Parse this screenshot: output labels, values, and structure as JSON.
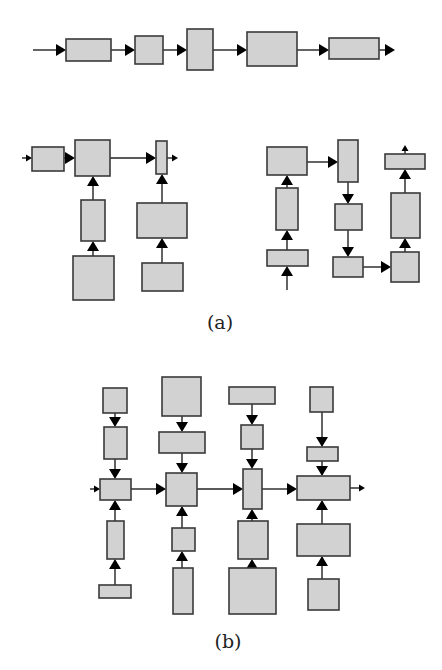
{
  "style": {
    "fill": "#d2d2d2",
    "stroke": "#3a3a3a",
    "line": "#222222"
  },
  "labels": [
    {
      "id": "label-a",
      "text": "(a)",
      "x": 220,
      "y": 313
    },
    {
      "id": "label-b",
      "text": "(b)",
      "x": 228,
      "y": 632
    }
  ],
  "boxes": [
    {
      "id": "t1",
      "x": 66,
      "y": 39,
      "w": 45,
      "h": 22
    },
    {
      "id": "t2",
      "x": 135,
      "y": 36,
      "w": 28,
      "h": 28
    },
    {
      "id": "t3",
      "x": 187,
      "y": 29,
      "w": 26,
      "h": 41
    },
    {
      "id": "t4",
      "x": 247,
      "y": 32,
      "w": 50,
      "h": 34
    },
    {
      "id": "t5",
      "x": 329,
      "y": 38,
      "w": 50,
      "h": 21
    },
    {
      "id": "a1",
      "x": 32,
      "y": 147,
      "w": 32,
      "h": 24
    },
    {
      "id": "a2",
      "x": 75,
      "y": 140,
      "w": 35,
      "h": 36
    },
    {
      "id": "a3",
      "x": 156,
      "y": 141,
      "w": 11,
      "h": 33
    },
    {
      "id": "a4",
      "x": 81,
      "y": 200,
      "w": 24,
      "h": 41
    },
    {
      "id": "a5",
      "x": 73,
      "y": 256,
      "w": 41,
      "h": 44
    },
    {
      "id": "a6",
      "x": 137,
      "y": 203,
      "w": 50,
      "h": 35
    },
    {
      "id": "a7",
      "x": 142,
      "y": 263,
      "w": 41,
      "h": 28
    },
    {
      "id": "r1",
      "x": 267,
      "y": 147,
      "w": 40,
      "h": 28
    },
    {
      "id": "r2",
      "x": 276,
      "y": 188,
      "w": 22,
      "h": 42
    },
    {
      "id": "r3",
      "x": 267,
      "y": 250,
      "w": 41,
      "h": 16
    },
    {
      "id": "r4",
      "x": 338,
      "y": 140,
      "w": 20,
      "h": 42
    },
    {
      "id": "r5",
      "x": 335,
      "y": 204,
      "w": 27,
      "h": 26
    },
    {
      "id": "r6",
      "x": 333,
      "y": 257,
      "w": 30,
      "h": 20
    },
    {
      "id": "r7",
      "x": 391,
      "y": 252,
      "w": 28,
      "h": 30
    },
    {
      "id": "r8",
      "x": 391,
      "y": 193,
      "w": 29,
      "h": 45
    },
    {
      "id": "r9",
      "x": 385,
      "y": 154,
      "w": 40,
      "h": 15
    },
    {
      "id": "b1a",
      "x": 103,
      "y": 388,
      "w": 24,
      "h": 25
    },
    {
      "id": "b1b",
      "x": 104,
      "y": 427,
      "w": 23,
      "h": 32
    },
    {
      "id": "b1m",
      "x": 100,
      "y": 479,
      "w": 31,
      "h": 21
    },
    {
      "id": "b1c",
      "x": 107,
      "y": 521,
      "w": 17,
      "h": 38
    },
    {
      "id": "b1d",
      "x": 99,
      "y": 585,
      "w": 32,
      "h": 13
    },
    {
      "id": "b2a",
      "x": 162,
      "y": 377,
      "w": 39,
      "h": 39
    },
    {
      "id": "b2b",
      "x": 159,
      "y": 432,
      "w": 46,
      "h": 21
    },
    {
      "id": "b2m",
      "x": 166,
      "y": 473,
      "w": 31,
      "h": 33
    },
    {
      "id": "b2c",
      "x": 172,
      "y": 528,
      "w": 23,
      "h": 23
    },
    {
      "id": "b2d",
      "x": 173,
      "y": 568,
      "w": 20,
      "h": 46
    },
    {
      "id": "b3a",
      "x": 229,
      "y": 387,
      "w": 46,
      "h": 17
    },
    {
      "id": "b3b",
      "x": 241,
      "y": 425,
      "w": 22,
      "h": 24
    },
    {
      "id": "b3m",
      "x": 243,
      "y": 469,
      "w": 19,
      "h": 40
    },
    {
      "id": "b3c",
      "x": 238,
      "y": 521,
      "w": 30,
      "h": 38
    },
    {
      "id": "b3d",
      "x": 229,
      "y": 568,
      "w": 47,
      "h": 46
    },
    {
      "id": "b4a",
      "x": 310,
      "y": 387,
      "w": 23,
      "h": 25
    },
    {
      "id": "b4b",
      "x": 307,
      "y": 447,
      "w": 31,
      "h": 14
    },
    {
      "id": "b4m",
      "x": 297,
      "y": 476,
      "w": 53,
      "h": 24
    },
    {
      "id": "b4c",
      "x": 297,
      "y": 524,
      "w": 53,
      "h": 32
    },
    {
      "id": "b4d",
      "x": 308,
      "y": 579,
      "w": 31,
      "h": 31
    }
  ],
  "arrows": [
    {
      "x1": 33,
      "y1": 50,
      "x2": 66,
      "y2": 50
    },
    {
      "x1": 111,
      "y1": 50,
      "x2": 135,
      "y2": 50
    },
    {
      "x1": 163,
      "y1": 50,
      "x2": 187,
      "y2": 50
    },
    {
      "x1": 213,
      "y1": 50,
      "x2": 247,
      "y2": 50
    },
    {
      "x1": 297,
      "y1": 50,
      "x2": 329,
      "y2": 50
    },
    {
      "x1": 379,
      "y1": 50,
      "x2": 395,
      "y2": 50
    },
    {
      "x1": 22,
      "y1": 158,
      "x2": 32,
      "y2": 158,
      "small": true
    },
    {
      "x1": 64,
      "y1": 158,
      "x2": 75,
      "y2": 158
    },
    {
      "x1": 110,
      "y1": 158,
      "x2": 156,
      "y2": 158
    },
    {
      "x1": 167,
      "y1": 158,
      "x2": 178,
      "y2": 158,
      "small": true
    },
    {
      "x1": 93,
      "y1": 200,
      "x2": 93,
      "y2": 176
    },
    {
      "x1": 93,
      "y1": 256,
      "x2": 93,
      "y2": 241
    },
    {
      "x1": 162,
      "y1": 203,
      "x2": 162,
      "y2": 174
    },
    {
      "x1": 162,
      "y1": 263,
      "x2": 162,
      "y2": 238
    },
    {
      "x1": 287,
      "y1": 290,
      "x2": 287,
      "y2": 266
    },
    {
      "x1": 287,
      "y1": 250,
      "x2": 287,
      "y2": 230
    },
    {
      "x1": 287,
      "y1": 188,
      "x2": 287,
      "y2": 175
    },
    {
      "x1": 307,
      "y1": 162,
      "x2": 338,
      "y2": 162
    },
    {
      "x1": 348,
      "y1": 182,
      "x2": 348,
      "y2": 204
    },
    {
      "x1": 348,
      "y1": 230,
      "x2": 348,
      "y2": 257
    },
    {
      "x1": 363,
      "y1": 267,
      "x2": 391,
      "y2": 267
    },
    {
      "x1": 405,
      "y1": 252,
      "x2": 405,
      "y2": 238
    },
    {
      "x1": 405,
      "y1": 193,
      "x2": 405,
      "y2": 169
    },
    {
      "x1": 405,
      "y1": 154,
      "x2": 405,
      "y2": 145,
      "small": true
    },
    {
      "x1": 115,
      "y1": 413,
      "x2": 115,
      "y2": 427
    },
    {
      "x1": 115,
      "y1": 459,
      "x2": 115,
      "y2": 479
    },
    {
      "x1": 90,
      "y1": 489,
      "x2": 100,
      "y2": 489,
      "small": true
    },
    {
      "x1": 115,
      "y1": 521,
      "x2": 115,
      "y2": 500
    },
    {
      "x1": 115,
      "y1": 585,
      "x2": 115,
      "y2": 559
    },
    {
      "x1": 131,
      "y1": 489,
      "x2": 166,
      "y2": 489
    },
    {
      "x1": 182,
      "y1": 416,
      "x2": 182,
      "y2": 432
    },
    {
      "x1": 182,
      "y1": 453,
      "x2": 182,
      "y2": 473
    },
    {
      "x1": 182,
      "y1": 528,
      "x2": 182,
      "y2": 506
    },
    {
      "x1": 182,
      "y1": 568,
      "x2": 182,
      "y2": 551
    },
    {
      "x1": 197,
      "y1": 489,
      "x2": 243,
      "y2": 489
    },
    {
      "x1": 252,
      "y1": 404,
      "x2": 252,
      "y2": 425
    },
    {
      "x1": 252,
      "y1": 449,
      "x2": 252,
      "y2": 469
    },
    {
      "x1": 252,
      "y1": 521,
      "x2": 252,
      "y2": 509
    },
    {
      "x1": 252,
      "y1": 568,
      "x2": 252,
      "y2": 559
    },
    {
      "x1": 262,
      "y1": 489,
      "x2": 297,
      "y2": 489
    },
    {
      "x1": 322,
      "y1": 412,
      "x2": 322,
      "y2": 447
    },
    {
      "x1": 322,
      "y1": 461,
      "x2": 322,
      "y2": 476
    },
    {
      "x1": 322,
      "y1": 524,
      "x2": 322,
      "y2": 500
    },
    {
      "x1": 322,
      "y1": 579,
      "x2": 322,
      "y2": 556
    },
    {
      "x1": 350,
      "y1": 488,
      "x2": 365,
      "y2": 488,
      "small": true
    }
  ]
}
